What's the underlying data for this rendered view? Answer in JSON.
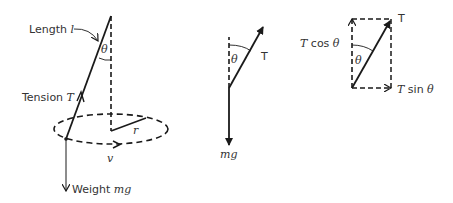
{
  "colors": {
    "line": "#1a1a1a",
    "text": "#333333",
    "background": "#ffffff"
  },
  "left_diagram": {
    "length_label": "Length ",
    "length_symbol": "l",
    "angle_symbol": "θ",
    "tension_label": "Tension ",
    "tension_symbol": "T",
    "radius_symbol": "r",
    "velocity_symbol": "v",
    "weight_label": "Weight ",
    "weight_symbol": "mg"
  },
  "middle_diagram": {
    "angle_symbol": "θ",
    "tension_symbol": "T",
    "weight_symbol": "mg"
  },
  "right_diagram": {
    "resultant_symbol": "T",
    "angle_symbol": "θ",
    "vertical_component_prefix": "T",
    "vertical_component_func": " cos ",
    "vertical_component_angle": "θ",
    "horizontal_component_prefix": "T",
    "horizontal_component_func": " sin ",
    "horizontal_component_angle": "θ"
  }
}
